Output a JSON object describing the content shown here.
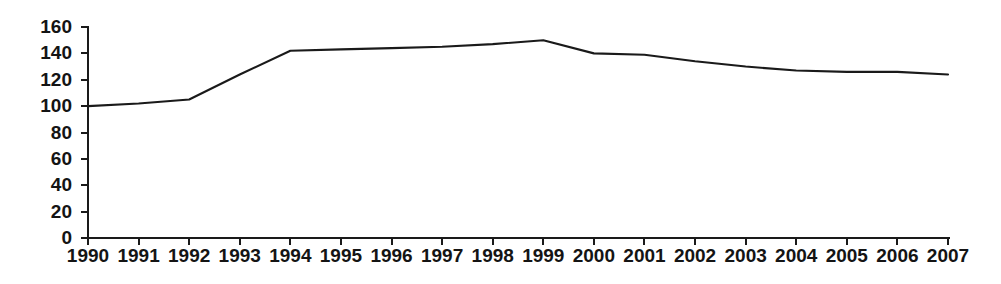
{
  "chart_data": {
    "type": "line",
    "title": "",
    "subtitle": "",
    "xlabel": "",
    "ylabel": "",
    "x": [
      1990,
      1991,
      1992,
      1993,
      1994,
      1995,
      1996,
      1997,
      1998,
      1999,
      2000,
      2001,
      2002,
      2003,
      2004,
      2005,
      2006,
      2007
    ],
    "categories": [
      "1990",
      "1991",
      "1992",
      "1993",
      "1994",
      "1995",
      "1996",
      "1997",
      "1998",
      "1999",
      "2000",
      "2001",
      "2002",
      "2003",
      "2004",
      "2005",
      "2006",
      "2007"
    ],
    "values": [
      100,
      102,
      105,
      124,
      142,
      143,
      144,
      145,
      147,
      150,
      140,
      139,
      134,
      130,
      127,
      126,
      126,
      124
    ],
    "series": [
      {
        "name": "index",
        "values": [
          100,
          102,
          105,
          124,
          142,
          143,
          144,
          145,
          147,
          150,
          140,
          139,
          134,
          130,
          127,
          126,
          126,
          124
        ],
        "color": "#1a1a1a"
      }
    ],
    "ylim": [
      0,
      160
    ],
    "yticks": [
      0,
      20,
      40,
      60,
      80,
      100,
      120,
      140,
      160
    ],
    "ytick_labels": [
      "0",
      "20",
      "40",
      "60",
      "80",
      "100",
      "120",
      "140",
      "160"
    ],
    "xlim": [
      1990,
      2007
    ],
    "xticks": [
      1990,
      1991,
      1992,
      1993,
      1994,
      1995,
      1996,
      1997,
      1998,
      1999,
      2000,
      2001,
      2002,
      2003,
      2004,
      2005,
      2006,
      2007
    ],
    "grid": false,
    "legend": null,
    "annotations": [],
    "line_color": "#1a1a1a",
    "axis_color": "#1a1a1a",
    "background_color": "#ffffff"
  },
  "layout": {
    "plot_left": 88,
    "plot_right": 948,
    "plot_top": 27,
    "plot_bottom": 238,
    "tick_length": 7,
    "xlabel_y": 248,
    "ylabel_x": 72
  }
}
